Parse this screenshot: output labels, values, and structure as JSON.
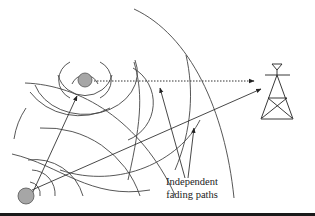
{
  "figure": {
    "label_line1": "Independent",
    "label_line2": "fading paths",
    "elements": {
      "upper_phone": {
        "cx": 85,
        "cy": 80,
        "r": 7,
        "fill": "#a6a6a6"
      },
      "lower_phone": {
        "cx": 26,
        "cy": 196,
        "r": 8,
        "fill": "#a6a6a6"
      },
      "tower": {
        "x": 277,
        "top": 63,
        "base_y": 119
      },
      "direct_path": {
        "style": "dotted",
        "from": [
          94,
          80
        ],
        "to": [
          254,
          80
        ]
      },
      "reflected_path": {
        "style": "solid",
        "from": [
          32,
          190
        ],
        "to": [
          261,
          88
        ]
      }
    },
    "colors": {
      "line": "#333333",
      "phone_fill": "#a6a6a6",
      "background": "#ffffff"
    }
  }
}
